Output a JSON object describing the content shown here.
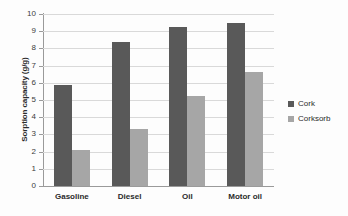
{
  "chart_data": {
    "type": "bar",
    "title": "",
    "subtitle": "",
    "xlabel": "",
    "ylabel": "Sorption capacity (g/g)",
    "categories": [
      "Gasoline",
      "Diesel",
      "Oil",
      "Motor oil"
    ],
    "series": [
      {
        "name": "Cork",
        "color": "#595959",
        "values": [
          5.9,
          8.35,
          9.25,
          9.5
        ]
      },
      {
        "name": "Corksorb",
        "color": "#a6a6a6",
        "values": [
          2.1,
          3.3,
          5.25,
          6.65
        ]
      }
    ],
    "ylim": [
      0,
      10
    ],
    "ytick_step": 1,
    "yticks": [
      10,
      9,
      8,
      7,
      6,
      5,
      4,
      3,
      2,
      1,
      0
    ],
    "ytick_labels": [
      "10",
      "9",
      "8",
      "7",
      "6",
      "5",
      "4",
      "3",
      "2",
      "1",
      "0"
    ],
    "grid": "horizontal",
    "legend_position": "right",
    "background_color": "#ffffff",
    "gridline_color": "#d9d9d9",
    "axis_color": "#9a9a9a"
  },
  "legend": {
    "entries": [
      {
        "label": "Cork",
        "color": "#595959"
      },
      {
        "label": "Corksorb",
        "color": "#a6a6a6"
      }
    ]
  }
}
